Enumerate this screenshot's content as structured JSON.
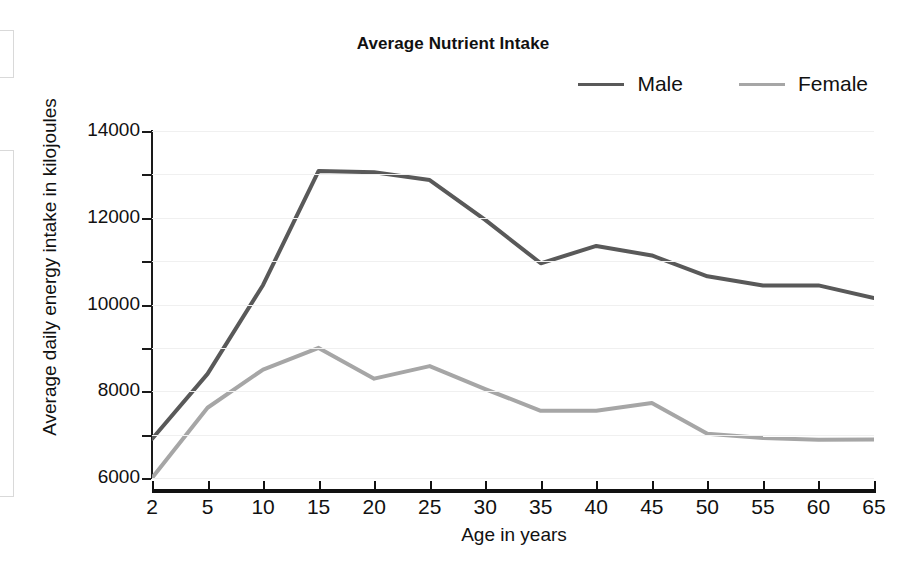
{
  "chart_data": {
    "type": "line",
    "title": "Average Nutrient Intake",
    "xlabel": "Age in years",
    "ylabel": "Average daily energy intake in kilojoules",
    "categories": [
      "2",
      "5",
      "10",
      "15",
      "20",
      "25",
      "30",
      "35",
      "40",
      "45",
      "50",
      "55",
      "60",
      "65"
    ],
    "x_tick_labels": [
      "2",
      "5",
      "10",
      "15",
      "20",
      "25",
      "30",
      "35",
      "40",
      "45",
      "50",
      "55",
      "60",
      "65"
    ],
    "y_tick_labels": [
      "14000",
      "12000",
      "10000",
      "8000",
      "6000"
    ],
    "y_major_ticks": [
      6000,
      8000,
      10000,
      12000,
      14000
    ],
    "y_minor_ticks": [
      7000,
      9000,
      11000,
      13000
    ],
    "ylim": [
      6000,
      14000
    ],
    "grid": true,
    "grid_axis": "y",
    "legend_position": "top-right",
    "series": [
      {
        "name": "Male",
        "color": "#595959",
        "values": [
          6900,
          8400,
          10450,
          13080,
          13050,
          12870,
          11950,
          10950,
          11350,
          11130,
          10650,
          10440,
          10440,
          10150
        ]
      },
      {
        "name": "Female",
        "color": "#a6a6a6",
        "values": [
          6000,
          7620,
          8500,
          9000,
          8290,
          8580,
          8050,
          7550,
          7550,
          7730,
          7020,
          6920,
          6880,
          6890
        ]
      }
    ]
  },
  "legend": {
    "items": [
      {
        "label": "Male",
        "color": "#595959"
      },
      {
        "label": "Female",
        "color": "#a6a6a6"
      }
    ]
  },
  "axes": {
    "y_title": "Average daily energy intake in kilojoules",
    "x_title": "Age in years"
  },
  "colors": {
    "male": "#595959",
    "female": "#a6a6a6",
    "axis": "#111111",
    "grid": "#f0f0f0",
    "background": "#ffffff"
  }
}
